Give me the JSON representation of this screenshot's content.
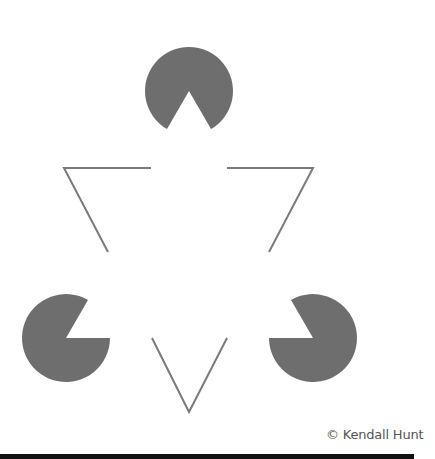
{
  "figure": {
    "pacman_color": "#6e6e6e",
    "line_color": "#7a7a7a",
    "pacmen": [
      {
        "name": "top",
        "cx": 189,
        "cy": 91,
        "r": 44,
        "mouth_direction_deg": 90,
        "mouth_half_angle_deg": 30
      },
      {
        "name": "bottom-left",
        "cx": 66,
        "cy": 338,
        "r": 44,
        "mouth_direction_deg": -30,
        "mouth_half_angle_deg": 30
      },
      {
        "name": "bottom-right",
        "cx": 313,
        "cy": 338,
        "r": 44,
        "mouth_direction_deg": 210,
        "mouth_half_angle_deg": 30
      }
    ],
    "line_segments": [
      {
        "name": "top-left-corner",
        "points": [
          [
            151,
            168
          ],
          [
            64,
            168
          ],
          [
            108,
            252
          ]
        ]
      },
      {
        "name": "top-right-corner",
        "points": [
          [
            227,
            168
          ],
          [
            313,
            168
          ],
          [
            269,
            252
          ]
        ]
      },
      {
        "name": "bottom-corner",
        "points": [
          [
            152,
            338
          ],
          [
            189,
            412
          ],
          [
            227,
            338
          ]
        ]
      }
    ]
  },
  "credit": "© Kendall Hunt"
}
